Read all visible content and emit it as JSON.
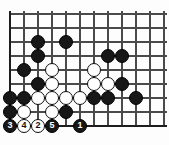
{
  "figure": {
    "kind": "go-board-diagram",
    "title": "",
    "board": {
      "columns": 12,
      "rows": 9,
      "origin_x": 10,
      "origin_y": 14,
      "spacing": 14,
      "stone_radius": 7.4,
      "line_color": "#4a4a4a",
      "edge_color": "#1d1d1d",
      "background_color": "#fdfdfd",
      "edges": {
        "left": true,
        "bottom": true,
        "top": false,
        "right": false
      }
    },
    "colors": {
      "black_stone": "#171717",
      "white_stone": "#ffffff",
      "stone_outline": "#0d0d0d",
      "label_on_black": "#ffffff",
      "label_on_white": "#111111"
    },
    "markers": [
      {
        "name": "hoshi-star-point",
        "col": 8,
        "row": 5
      }
    ],
    "black_stones": [
      {
        "col": 2,
        "row": 2
      },
      {
        "col": 4,
        "row": 2
      },
      {
        "col": 2,
        "row": 3
      },
      {
        "col": 7,
        "row": 3
      },
      {
        "col": 8,
        "row": 3
      },
      {
        "col": 1,
        "row": 4
      },
      {
        "col": 2,
        "row": 5
      },
      {
        "col": 8,
        "row": 5
      },
      {
        "col": 0,
        "row": 6
      },
      {
        "col": 1,
        "row": 6
      },
      {
        "col": 6,
        "row": 6
      },
      {
        "col": 7,
        "row": 6
      },
      {
        "col": 9,
        "row": 6
      },
      {
        "col": 0,
        "row": 7
      },
      {
        "col": 4,
        "row": 7
      }
    ],
    "white_stones": [
      {
        "col": 3,
        "row": 4
      },
      {
        "col": 6,
        "row": 4
      },
      {
        "col": 3,
        "row": 5
      },
      {
        "col": 6,
        "row": 5
      },
      {
        "col": 7,
        "row": 5
      },
      {
        "col": 2,
        "row": 6
      },
      {
        "col": 3,
        "row": 6
      },
      {
        "col": 4,
        "row": 6
      },
      {
        "col": 5,
        "row": 6
      },
      {
        "col": 1,
        "row": 7
      },
      {
        "col": 3,
        "row": 7
      }
    ],
    "numbered_moves": [
      {
        "label": "1",
        "col": 5,
        "row": 8,
        "color": "black"
      },
      {
        "label": "2",
        "col": 2,
        "row": 8,
        "color": "white"
      },
      {
        "label": "3",
        "col": 0,
        "row": 8,
        "color": "black"
      },
      {
        "label": "4",
        "col": 1,
        "row": 8,
        "color": "white"
      },
      {
        "label": "5",
        "col": 3,
        "row": 8,
        "color": "black"
      }
    ]
  }
}
